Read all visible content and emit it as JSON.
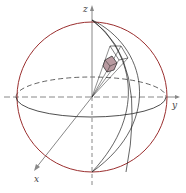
{
  "diagram": {
    "axes": {
      "x_label": "x",
      "y_label": "y",
      "z_label": "z"
    },
    "colors": {
      "sphere": "#9b2f2f",
      "axes": "#888888",
      "lines": "#222222",
      "element_fill": "#b89aa0"
    }
  }
}
